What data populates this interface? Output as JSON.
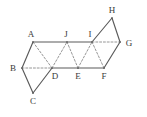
{
  "figure": {
    "kind": "geometric-net-diagram",
    "width": 147,
    "height": 117,
    "background_color": "#ffffff",
    "stroke_color": "#5a5a5a",
    "dashed_stroke_color": "#8a8a8a",
    "label_color": "#3a3a3a",
    "vertices": [
      {
        "id": "A",
        "label": "A",
        "x": 33,
        "y": 42,
        "label_x": 31,
        "label_y": 34
      },
      {
        "id": "B",
        "label": "B",
        "x": 22,
        "y": 68,
        "label_x": 13,
        "label_y": 68
      },
      {
        "id": "C",
        "label": "C",
        "x": 33,
        "y": 93,
        "label_x": 33,
        "label_y": 101
      },
      {
        "id": "D",
        "label": "D",
        "x": 52,
        "y": 68,
        "label_x": 55,
        "label_y": 76
      },
      {
        "id": "E",
        "label": "E",
        "x": 78,
        "y": 68,
        "label_x": 78,
        "label_y": 76
      },
      {
        "id": "F",
        "label": "F",
        "x": 104,
        "y": 68,
        "label_x": 104,
        "label_y": 76
      },
      {
        "id": "G",
        "label": "G",
        "x": 120,
        "y": 42,
        "label_x": 129,
        "label_y": 43
      },
      {
        "id": "H",
        "label": "H",
        "x": 112,
        "y": 18,
        "label_x": 112,
        "label_y": 10
      },
      {
        "id": "I",
        "label": "I",
        "x": 92,
        "y": 42,
        "label_x": 90,
        "label_y": 34
      },
      {
        "id": "J",
        "label": "J",
        "x": 67,
        "y": 42,
        "label_x": 66,
        "label_y": 34
      }
    ],
    "edges_solid": [
      {
        "from": "A",
        "to": "J"
      },
      {
        "from": "J",
        "to": "I"
      },
      {
        "from": "I",
        "to": "H"
      },
      {
        "from": "H",
        "to": "G"
      },
      {
        "from": "G",
        "to": "F"
      },
      {
        "from": "F",
        "to": "E"
      },
      {
        "from": "E",
        "to": "D"
      },
      {
        "from": "D",
        "to": "C"
      },
      {
        "from": "C",
        "to": "B"
      },
      {
        "from": "B",
        "to": "A"
      }
    ],
    "edges_dashed": [
      {
        "from": "A",
        "to": "D"
      },
      {
        "from": "B",
        "to": "D"
      },
      {
        "from": "D",
        "to": "J"
      },
      {
        "from": "J",
        "to": "E"
      },
      {
        "from": "E",
        "to": "I"
      },
      {
        "from": "I",
        "to": "F"
      },
      {
        "from": "I",
        "to": "G"
      }
    ]
  }
}
